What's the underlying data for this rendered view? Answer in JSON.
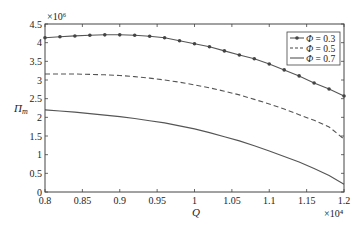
{
  "chart_data": {
    "type": "line",
    "title": "",
    "xlabel": "Q",
    "ylabel": "Π_m",
    "x_multiplier": "×10⁴",
    "y_multiplier": "×10⁶",
    "xlim": [
      0.8,
      1.2
    ],
    "ylim": [
      0,
      4.5
    ],
    "x_ticks": [
      "0.8",
      "0.85",
      "0.9",
      "0.95",
      "1",
      "1.05",
      "1.1",
      "1.15",
      "1.2"
    ],
    "y_ticks": [
      "0",
      "0.5",
      "1",
      "1.5",
      "2",
      "2.5",
      "3",
      "3.5",
      "4",
      "4.5"
    ],
    "grid": false,
    "legend_position": "upper right",
    "x": [
      0.8,
      0.82,
      0.84,
      0.86,
      0.88,
      0.9,
      0.92,
      0.94,
      0.96,
      0.98,
      1.0,
      1.02,
      1.04,
      1.06,
      1.08,
      1.1,
      1.12,
      1.14,
      1.16,
      1.18,
      1.2
    ],
    "series": [
      {
        "name": "Φ = 0.3",
        "style": "solid-marker",
        "values": [
          4.13,
          4.16,
          4.18,
          4.2,
          4.21,
          4.21,
          4.2,
          4.17,
          4.13,
          4.05,
          3.97,
          3.89,
          3.78,
          3.67,
          3.57,
          3.43,
          3.27,
          3.11,
          2.92,
          2.76,
          2.57
        ]
      },
      {
        "name": "Φ = 0.5",
        "style": "dashed",
        "values": [
          3.16,
          3.16,
          3.16,
          3.15,
          3.14,
          3.12,
          3.09,
          3.05,
          3.0,
          2.94,
          2.87,
          2.79,
          2.7,
          2.6,
          2.48,
          2.36,
          2.22,
          2.07,
          1.92,
          1.74,
          1.42
        ]
      },
      {
        "name": "Φ = 0.7",
        "style": "solid",
        "values": [
          2.2,
          2.17,
          2.14,
          2.1,
          2.06,
          2.02,
          1.97,
          1.91,
          1.85,
          1.77,
          1.69,
          1.59,
          1.48,
          1.37,
          1.24,
          1.1,
          0.95,
          0.8,
          0.63,
          0.44,
          0.21
        ]
      }
    ]
  }
}
